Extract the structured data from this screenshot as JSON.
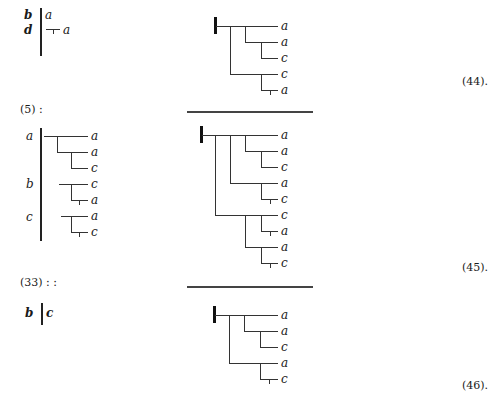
{
  "blocks": [
    {
      "rule_label": "",
      "left_column": [
        {
          "label": "b",
          "entries": [
            "a"
          ]
        },
        {
          "label": "d",
          "entries": [
            "a"
          ]
        }
      ],
      "tree_leaves": [
        "a",
        "a",
        "c",
        "c",
        "a"
      ],
      "equation_number": "(44)."
    },
    {
      "rule_label": "(5) :",
      "left_column": [
        {
          "label": "a",
          "entries": [
            "a",
            "a",
            "c"
          ]
        },
        {
          "label": "b",
          "entries": [
            "c",
            "a"
          ]
        },
        {
          "label": "c",
          "entries": [
            "a",
            "c"
          ]
        }
      ],
      "tree_leaves": [
        "a",
        "a",
        "c",
        "a",
        "c",
        "c",
        "a",
        "a",
        "c"
      ],
      "equation_number": "(45)."
    },
    {
      "rule_label": "(33) : :",
      "left_column": [
        {
          "label": "b",
          "entries": [
            "c"
          ]
        }
      ],
      "tree_leaves": [
        "a",
        "a",
        "c",
        "a",
        "c"
      ],
      "equation_number": "(46)."
    }
  ]
}
